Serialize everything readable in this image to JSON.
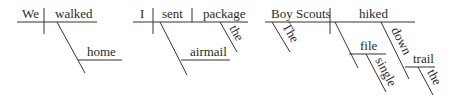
{
  "diagrams": [
    {
      "sentence_parts": {
        "subject": "We",
        "verb": "walked",
        "adverb": "home"
      }
    },
    {
      "sentence_parts": {
        "subject": "I",
        "verb": "sent",
        "direct_object": "package",
        "object_modifier": "the",
        "prepositional_modifier": "airmail"
      }
    },
    {
      "sentence_parts": {
        "subject": "Boy Scouts",
        "subject_modifier": "The",
        "verb": "hiked",
        "adverbial_object": "file",
        "adverbial_object_modifier": "single",
        "preposition": "down",
        "prep_object": "trail",
        "prep_object_modifier": "the"
      }
    }
  ],
  "colors": {
    "ink": "#333333",
    "background": "#ffffff"
  }
}
